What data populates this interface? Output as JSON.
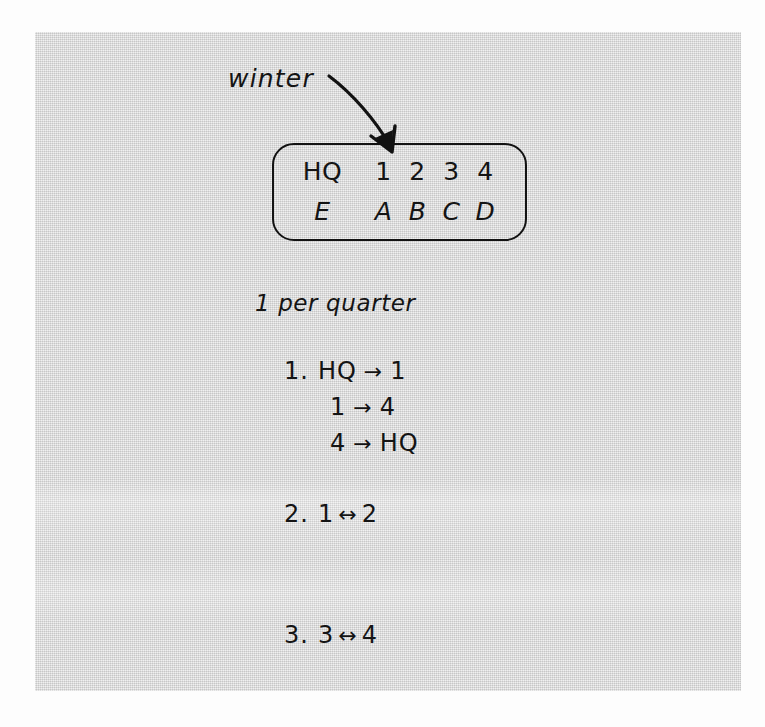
{
  "annotation": {
    "label": "winter",
    "arrow_icon": "curved-down-right-arrow-icon"
  },
  "grid": {
    "rows": [
      {
        "name": "nodes",
        "cells": [
          "HQ",
          "1",
          "2",
          "3",
          "4"
        ]
      },
      {
        "name": "letters",
        "cells": [
          "E",
          "A",
          "B",
          "C",
          "D"
        ]
      }
    ]
  },
  "rate_line": "1 per quarter",
  "rules": [
    {
      "number": "1.",
      "lines": [
        {
          "from": "HQ",
          "arrow": "→",
          "to": "1"
        },
        {
          "from": "1",
          "arrow": "→",
          "to": "4"
        },
        {
          "from": "4",
          "arrow": "→",
          "to": "HQ"
        }
      ]
    },
    {
      "number": "2.",
      "lines": [
        {
          "from": "1",
          "arrow": "↔",
          "to": "2"
        }
      ]
    },
    {
      "number": "3.",
      "lines": [
        {
          "from": "3",
          "arrow": "↔",
          "to": "4"
        }
      ]
    }
  ],
  "colors": {
    "ink": "#141414",
    "paper": "#d9d9d9",
    "page": "#fdfdfd"
  }
}
